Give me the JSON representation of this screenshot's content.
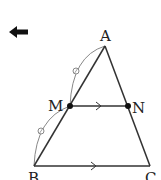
{
  "diagram": {
    "type": "geometry",
    "back_arrow_icon": "left-arrow-icon",
    "points": {
      "A": {
        "label": "A",
        "x": 105,
        "y": 46
      },
      "M": {
        "label": "M",
        "x": 70,
        "y": 106
      },
      "N": {
        "label": "N",
        "x": 128,
        "y": 106
      },
      "B": {
        "label": "B",
        "x": 34,
        "y": 166
      },
      "C": {
        "label": "C",
        "x": 150,
        "y": 166
      }
    },
    "segments": [
      "AB",
      "AC",
      "MN",
      "BC"
    ],
    "parallel_marks": [
      "MN",
      "BC"
    ],
    "equal_arcs": [
      "AM",
      "MB"
    ],
    "colors": {
      "line": "#333333",
      "arc": "#888888",
      "point": "#111111"
    }
  }
}
